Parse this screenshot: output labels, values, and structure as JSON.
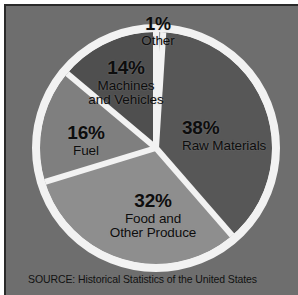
{
  "figure": {
    "background_color": "#6e6e6e",
    "border_color": "#2a2a2a",
    "divider_color": "#f2f2f2",
    "source_note": "SOURCE: Historical Statistics of the United States"
  },
  "chart_data": {
    "type": "pie",
    "title": "",
    "subtitle": "",
    "xlabel": "",
    "ylabel": "",
    "legend_position": "none",
    "grid": false,
    "units": "percent",
    "total": 101,
    "start_angle_deg": 0,
    "direction": "clockwise",
    "categories": [
      "Other",
      "Raw Materials",
      "Food and Other Produce",
      "Fuel",
      "Machines and Vehicles"
    ],
    "values": [
      1,
      38,
      32,
      16,
      14
    ],
    "slices": [
      {
        "name": "Other",
        "value": 1,
        "percent_label": "1%",
        "label_line1": "Other",
        "label_line2": "",
        "color": "#9a9a9a",
        "start_deg": 0,
        "end_deg": 3.6
      },
      {
        "name": "Raw Materials",
        "value": 38,
        "percent_label": "38%",
        "label_line1": "Raw Materials",
        "label_line2": "",
        "color": "#575757",
        "start_deg": 3.6,
        "end_deg": 139.0
      },
      {
        "name": "Food and Other Produce",
        "value": 32,
        "percent_label": "32%",
        "label_line1": "Food and",
        "label_line2": "Other Produce",
        "color": "#8e8e8e",
        "start_deg": 139.0,
        "end_deg": 253.0
      },
      {
        "name": "Fuel",
        "value": 16,
        "percent_label": "16%",
        "label_line1": "Fuel",
        "label_line2": "",
        "color": "#7f7f7f",
        "start_deg": 253.0,
        "end_deg": 310.0
      },
      {
        "name": "Machines and Vehicles",
        "value": 14,
        "percent_label": "14%",
        "label_line1": "Machines",
        "label_line2": "and Vehicles",
        "color": "#4f4f4f",
        "start_deg": 310.0,
        "end_deg": 360.0
      }
    ]
  }
}
